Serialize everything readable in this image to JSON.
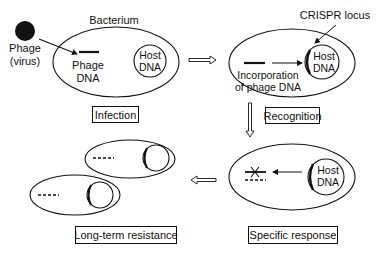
{
  "diagram": {
    "colors": {
      "ink": "#111111",
      "background": "#ffffff"
    },
    "phage": {
      "label_line1": "Phage",
      "label_line2": "(virus)"
    },
    "stages": {
      "infection": {
        "cell_label": "Bacterium",
        "phage_dna_line1": "Phage",
        "phage_dna_line2": "DNA",
        "host_dna_line1": "Host",
        "host_dna_line2": "DNA",
        "caption": "Infection"
      },
      "recognition": {
        "crispr_label": "CRISPR locus",
        "incorporation_line1": "Incorporation",
        "incorporation_line2": "of phage DNA",
        "host_dna_line1": "Host",
        "host_dna_line2": "DNA",
        "caption": "Recognition"
      },
      "specific_response": {
        "host_dna_line1": "Host",
        "host_dna_line2": "DNA",
        "caption": "Specific response"
      },
      "long_term_resistance": {
        "caption": "Long-term resistance"
      }
    },
    "flow": [
      "Infection",
      "Recognition",
      "Specific response",
      "Long-term resistance"
    ]
  }
}
